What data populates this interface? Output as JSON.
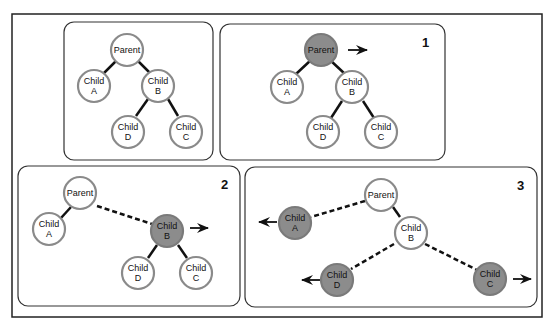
{
  "colors": {
    "node_stroke": "#8a8a8a",
    "node_fill": "#ffffff",
    "visited_fill": "#8c8c8c",
    "edge": "#111111",
    "panel_border": "#333333",
    "frame_border": "#222222"
  },
  "panels": [
    {
      "number": "",
      "nodes": {
        "parent": {
          "line1": "Parent",
          "line2": "",
          "visited": false
        },
        "a": {
          "line1": "Child",
          "line2": "A",
          "visited": false
        },
        "b": {
          "line1": "Child",
          "line2": "B",
          "visited": false
        },
        "d": {
          "line1": "Child",
          "line2": "D",
          "visited": false
        },
        "c": {
          "line1": "Child",
          "line2": "C",
          "visited": false
        }
      }
    },
    {
      "number": "1",
      "nodes": {
        "parent": {
          "line1": "Parent",
          "line2": "",
          "visited": true
        },
        "a": {
          "line1": "Child",
          "line2": "A",
          "visited": false
        },
        "b": {
          "line1": "Child",
          "line2": "B",
          "visited": false
        },
        "d": {
          "line1": "Child",
          "line2": "D",
          "visited": false
        },
        "c": {
          "line1": "Child",
          "line2": "C",
          "visited": false
        }
      }
    },
    {
      "number": "2",
      "nodes": {
        "parent": {
          "line1": "Parent",
          "line2": "",
          "visited": false
        },
        "a": {
          "line1": "Child",
          "line2": "A",
          "visited": false
        },
        "b": {
          "line1": "Child",
          "line2": "B",
          "visited": true
        },
        "d": {
          "line1": "Child",
          "line2": "D",
          "visited": false
        },
        "c": {
          "line1": "Child",
          "line2": "C",
          "visited": false
        }
      }
    },
    {
      "number": "3",
      "nodes": {
        "parent": {
          "line1": "Parent",
          "line2": "",
          "visited": false
        },
        "a": {
          "line1": "Child",
          "line2": "A",
          "visited": true
        },
        "b": {
          "line1": "Child",
          "line2": "B",
          "visited": false
        },
        "d": {
          "line1": "Child",
          "line2": "D",
          "visited": true
        },
        "c": {
          "line1": "Child",
          "line2": "C",
          "visited": true
        }
      }
    }
  ]
}
